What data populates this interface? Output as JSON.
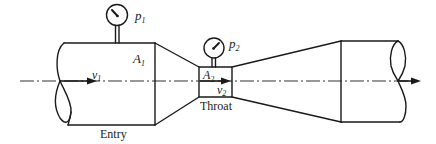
{
  "diagram": {
    "type": "venturi-meter",
    "colors": {
      "stroke": "#1a1a1a",
      "background": "#ffffff"
    },
    "labels": {
      "p1": {
        "main": "p",
        "sub": "1"
      },
      "p2": {
        "main": "p",
        "sub": "2"
      },
      "A1": {
        "main": "A",
        "sub": "1"
      },
      "A2": {
        "main": "A",
        "sub": "2"
      },
      "v1": {
        "main": "v",
        "sub": "1"
      },
      "v2": {
        "main": "v",
        "sub": "2"
      },
      "entry": "Entry",
      "throat": "Throat"
    },
    "components": [
      "entry-pipe",
      "converging-cone",
      "throat",
      "diverging-cone",
      "exit-pipe",
      "pressure-gauge-1",
      "pressure-gauge-2",
      "centerline",
      "flow-arrows"
    ]
  }
}
